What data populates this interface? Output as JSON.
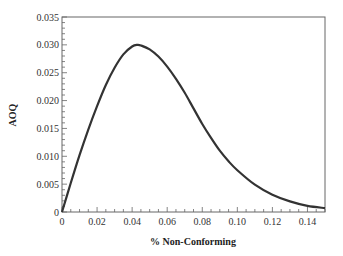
{
  "chart_data": {
    "type": "line",
    "title": "",
    "xlabel": "% Non-Conforming",
    "ylabel": "AOQ",
    "xlim": [
      0,
      0.15
    ],
    "ylim": [
      0,
      0.035
    ],
    "grid": false,
    "legend": null,
    "x_ticks": [
      "0",
      "0.02",
      "0.04",
      "0.06",
      "0.08",
      "0.10",
      "0.12",
      "0.14"
    ],
    "y_ticks": [
      "0",
      "0.005",
      "0.010",
      "0.015",
      "0.020",
      "0.025",
      "0.030",
      "0.035"
    ],
    "series": [
      {
        "name": "AOQ",
        "color": "#333333",
        "x": [
          0,
          0.005,
          0.01,
          0.015,
          0.02,
          0.025,
          0.03,
          0.035,
          0.04,
          0.043,
          0.045,
          0.05,
          0.055,
          0.06,
          0.065,
          0.07,
          0.075,
          0.08,
          0.085,
          0.09,
          0.095,
          0.1,
          0.11,
          0.12,
          0.13,
          0.14,
          0.15
        ],
        "y": [
          0,
          0.0052,
          0.0102,
          0.0148,
          0.019,
          0.0228,
          0.0259,
          0.0283,
          0.0297,
          0.03,
          0.0299,
          0.0292,
          0.0279,
          0.0261,
          0.0239,
          0.0214,
          0.0186,
          0.0158,
          0.0133,
          0.011,
          0.0091,
          0.0075,
          0.0049,
          0.0031,
          0.0019,
          0.0011,
          0.0007
        ]
      }
    ]
  }
}
